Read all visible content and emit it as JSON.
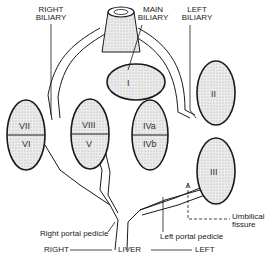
{
  "labels": {
    "right_biliary": [
      "RIGHT",
      "BILIARY"
    ],
    "main_biliary": [
      "MAIN",
      "BILIARY"
    ],
    "left_biliary": [
      "LEFT",
      "BILIARY"
    ],
    "right_portal_pedicle": "Right portal pedicle",
    "left_portal_pedicle": "Left portal pedicle",
    "umbilical_fissure": [
      "Umbilical",
      "fissure"
    ],
    "axis_right": "RIGHT",
    "axis_liver": "LIVER",
    "axis_left": "LEFT"
  },
  "segments": {
    "I": "I",
    "II": "II",
    "III": "III",
    "IVa": "IVa",
    "IVb": "IVb",
    "V": "V",
    "VI": "VI",
    "VII": "VII",
    "VIII": "VIII"
  },
  "colors": {
    "outline": "#1a1a1a",
    "stipple": "#bdbdbd",
    "segment_fill": "#e6e6e6"
  }
}
